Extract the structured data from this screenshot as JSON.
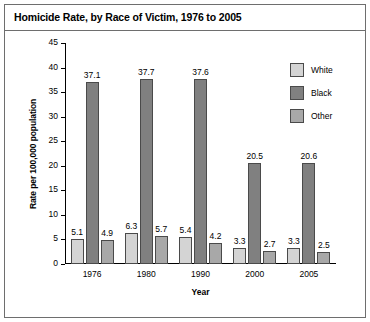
{
  "title": "Homicide Rate, by Race of Victim, 1976 to 2005",
  "legend": {
    "position": "top-right",
    "items": [
      {
        "label": "White",
        "color": "#d4d4d4"
      },
      {
        "label": "Black",
        "color": "#808080"
      },
      {
        "label": "Other",
        "color": "#a8a8a8"
      }
    ]
  },
  "chart_data": {
    "type": "bar",
    "title": "Homicide Rate, by Race of Victim, 1976 to 2005",
    "xlabel": "Year",
    "ylabel": "Rate per 100,000 population",
    "categories": [
      "1976",
      "1980",
      "1990",
      "2000",
      "2005"
    ],
    "series": [
      {
        "name": "White",
        "color": "#d4d4d4",
        "values": [
          5.1,
          6.3,
          5.4,
          3.3,
          3.3
        ]
      },
      {
        "name": "Black",
        "color": "#808080",
        "values": [
          37.1,
          37.7,
          37.6,
          20.5,
          20.6
        ]
      },
      {
        "name": "Other",
        "color": "#a8a8a8",
        "values": [
          4.9,
          5.7,
          4.2,
          2.7,
          2.5
        ]
      }
    ],
    "ylim": [
      0,
      45
    ],
    "yticks": [
      "0",
      "5",
      "10",
      "15",
      "20",
      "25",
      "30",
      "35",
      "40",
      "45"
    ],
    "grid": false,
    "data_labels": true
  }
}
